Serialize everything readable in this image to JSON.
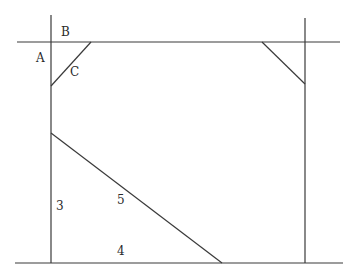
{
  "diagram": {
    "type": "geometric-figure",
    "labels": {
      "A": "A",
      "B": "B",
      "C": "C",
      "three": "3",
      "four": "4",
      "five": "5"
    },
    "lines": [
      {
        "id": "top-horizontal",
        "x1": 17,
        "y1": 42,
        "x2": 340,
        "y2": 42
      },
      {
        "id": "bottom-horizontal",
        "x1": 15,
        "y1": 263,
        "x2": 343,
        "y2": 263
      },
      {
        "id": "left-vertical",
        "x1": 51,
        "y1": 15,
        "x2": 51,
        "y2": 263
      },
      {
        "id": "right-vertical",
        "x1": 305,
        "y1": 18,
        "x2": 305,
        "y2": 263
      },
      {
        "id": "corner-diagonal-left-C",
        "x1": 51,
        "y1": 86,
        "x2": 91,
        "y2": 42
      },
      {
        "id": "corner-diagonal-right",
        "x1": 262,
        "y1": 42,
        "x2": 305,
        "y2": 84
      },
      {
        "id": "hypotenuse-5",
        "x1": 51,
        "y1": 133,
        "x2": 222,
        "y2": 263
      }
    ],
    "colors": {
      "line": "#3a3a3a",
      "text": "#2a2a2a",
      "background": "#ffffff"
    }
  }
}
